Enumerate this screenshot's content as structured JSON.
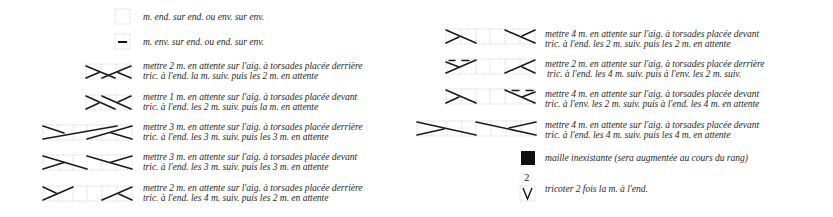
{
  "legend": {
    "left": [
      {
        "symbol": "empty-square-icon",
        "lines": [
          "m. end. sur end. ou env. sur env."
        ]
      },
      {
        "symbol": "dash-square-icon",
        "lines": [
          "m. env. sur end. ou end. sur env."
        ]
      },
      {
        "symbol": "cable-2-1-back-icon",
        "lines": [
          "mettre 2 m. en attente sur l'aig. à torsades placée derrière",
          "tric. à l'end. la m. suiv. puis les 2 m. en attente"
        ]
      },
      {
        "symbol": "cable-1-2-front-icon",
        "lines": [
          "mettre 1 m. en attente sur l'aig. à torsades placée devant",
          "tric. à l'end. les 2 m. suiv. puis la m. en attente"
        ]
      },
      {
        "symbol": "cable-3-3-back-icon",
        "lines": [
          "mettre 3 m. en attente sur l'aig. à torsades placée derrière",
          "tric. à l'end. les 3 m. suiv. puis les 3 m. en attente"
        ]
      },
      {
        "symbol": "cable-3-3-front-icon",
        "lines": [
          "mettre 3 m. en attente sur l'aig. à torsades placée devant",
          "tric. à l'end. les 3 m. suiv. puis les 3 m. en attente"
        ]
      },
      {
        "symbol": "cable-2-4-back-icon",
        "lines": [
          "mettre 2 m. en attente sur l'aig. à torsades placée derrière",
          "tric. à l'end. les 4 m. suiv. puis les 2 m. en attente"
        ]
      }
    ],
    "right": [
      {
        "symbol": "cable-4-2-front-icon",
        "lines": [
          "mettre 4 m. en attente sur l'aig. à torsades placée devant",
          "tric. à l'end. les 2 m. suiv. puis les 2 m. en attente"
        ]
      },
      {
        "symbol": "cable-2-4-back-purl-icon",
        "lines": [
          "mettre 2 m. en attente sur l'aig. à torsades placée derrière",
          "tric. à l'end. les 4 m. suiv. puis à l'env. les 2 m. suiv."
        ]
      },
      {
        "symbol": "cable-4-2-front-purl-icon",
        "lines": [
          "mettre 4 m. en attente sur l'aig. à torsades placée devant",
          "tric. à l'env. les 2 m. suiv. puis à l'end. les 4 m. en attente"
        ]
      },
      {
        "symbol": "cable-4-4-front-icon",
        "lines": [
          "mettre 4 m. en attente sur l'aig. à torsades placée devant",
          "tric. à l'end. les 4 m. suiv. puis les 4 m. en attente"
        ]
      },
      {
        "symbol": "black-square-icon",
        "lines": [
          "maille inexistante (sera augmentée au cours du rang)"
        ]
      },
      {
        "symbol": "v-increase-icon",
        "label_above": "2",
        "lines": [
          "tricoter 2 fois la m. à l'end."
        ]
      }
    ]
  },
  "colors": {
    "ink": "#1a1a1a",
    "grid": "#bdbdbd",
    "text": "#2b2b2b",
    "background": "#ffffff"
  }
}
